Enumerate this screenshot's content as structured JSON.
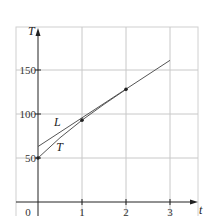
{
  "chart_data": {
    "type": "line",
    "title": "",
    "xlabel": "t",
    "ylabel": "T",
    "origin_label": "0",
    "xlim": [
      0,
      3.2
    ],
    "ylim": [
      0,
      185
    ],
    "grid": true,
    "x_ticks": [
      1,
      2,
      3
    ],
    "x_tick_labels": [
      "1",
      "2",
      "3"
    ],
    "y_ticks": [
      50,
      100,
      150
    ],
    "y_tick_labels": [
      "50",
      "100",
      "150"
    ],
    "legend": "none (inline curve labels)",
    "series": [
      {
        "name": "L",
        "kind": "straight line (tangent/linear approximation)",
        "x": [
          0,
          1,
          2,
          3
        ],
        "y": [
          63,
          95,
          128,
          161
        ],
        "label_position": {
          "x": 0.5,
          "y": 91
        }
      },
      {
        "name": "T",
        "kind": "curve",
        "x": [
          0,
          0.5,
          1,
          1.5,
          2
        ],
        "y": [
          50,
          73,
          93,
          111,
          128
        ],
        "label_position": {
          "x": 0.55,
          "y": 62
        }
      }
    ],
    "points": [
      {
        "x": 0,
        "y": 50
      },
      {
        "x": 1,
        "y": 93
      },
      {
        "x": 2,
        "y": 128
      }
    ],
    "colors": {
      "grid": "#c8c8c8",
      "axis": "#222222",
      "line_L": "#555555",
      "curve_T": "#555555",
      "points": "#222222",
      "frame": "#d0d0d0"
    }
  }
}
